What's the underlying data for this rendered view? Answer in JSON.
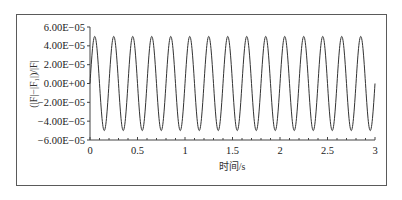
{
  "chart_data": {
    "type": "line",
    "title": "",
    "xlabel": "时间/s",
    "ylabel": "(|F|−|F₁|)/|F|",
    "xlim": [
      0,
      3
    ],
    "ylim": [
      -6e-05,
      6e-05
    ],
    "x_ticks": [
      "0",
      "0.5",
      "1",
      "1.5",
      "2",
      "2.5",
      "3"
    ],
    "y_ticks": [
      "6.00E−05",
      "4.00E−05",
      "2.00E−05",
      "0.00E+00",
      "−2.00E−05",
      "−4.00E−05",
      "−6.00E−05"
    ],
    "grid": false,
    "legend": null,
    "series": [
      {
        "name": "relative force deviation",
        "function": "A*sin(2*pi*f*t)",
        "amplitude": 5e-05,
        "frequency_hz": 5,
        "cycles": 15,
        "color": "#333333"
      }
    ]
  },
  "axes": {
    "xlabel": "时间/s",
    "ylabel": "(|F|−|F₁|)/|F|"
  }
}
